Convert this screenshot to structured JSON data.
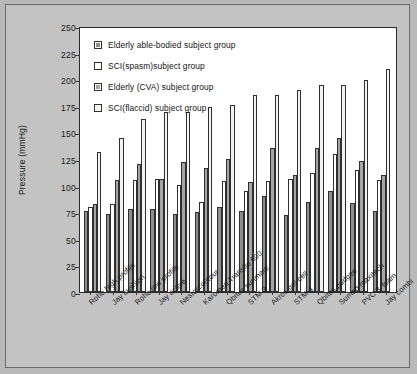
{
  "chart_data": {
    "type": "bar",
    "title": "",
    "xlabel": "",
    "ylabel": "Pressure (mmHg)",
    "ylim": [
      0,
      250
    ],
    "ytick_step": 25,
    "yticks": [
      0,
      25,
      50,
      75,
      100,
      125,
      150,
      175,
      200,
      225,
      250
    ],
    "grid": false,
    "legend_position": "top-left",
    "categories": [
      "Roho high profile",
      "Jay cushion",
      "Roho low profile",
      "Jay active",
      "Nestorcontour",
      "Karomed Transflo 600",
      "Qbitus sunmate",
      "STM 3",
      "Akros gel cell",
      "STM 4",
      "Qbitus pudgee",
      "Sumed maxitech",
      "PVC 3 'foam",
      "Jay combi"
    ],
    "series": [
      {
        "name": "Elderly able-bodied  subject group",
        "color": "#8e8e8e",
        "values": [
          76,
          73,
          78,
          78,
          73,
          75,
          80,
          76,
          90,
          72,
          85,
          95,
          84,
          76
        ]
      },
      {
        "name": "SCI(spasm)subject group",
        "color": "#ffffff",
        "values": [
          80,
          83,
          105,
          106,
          101,
          85,
          104,
          95,
          104,
          106,
          112,
          130,
          115,
          105
        ]
      },
      {
        "name": "Elderly (CVA) subject group",
        "color": "#a5a5a5",
        "values": [
          83,
          105,
          120,
          106,
          122,
          117,
          125,
          103,
          135,
          110,
          135,
          145,
          123,
          110
        ]
      },
      {
        "name": "SCI(flaccid) subject group",
        "color": "#f2f2f2",
        "values": [
          132,
          145,
          163,
          169,
          169,
          174,
          176,
          185,
          185,
          190,
          195,
          195,
          199,
          210
        ]
      }
    ]
  },
  "legend": {
    "items": [
      {
        "label": "Elderly able-bodied  subject group"
      },
      {
        "label": "SCI(spasm)subject group"
      },
      {
        "label": "Elderly (CVA) subject group"
      },
      {
        "label": "SCI(flaccid) subject group"
      }
    ]
  }
}
